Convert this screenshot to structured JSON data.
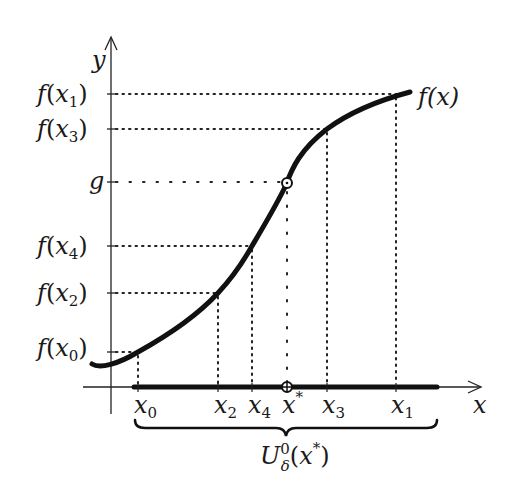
{
  "figure": {
    "axes": {
      "x_label": "x",
      "y_label": "y"
    },
    "curve_label": "f(x)",
    "y_ticks": [
      {
        "id": "fx1",
        "label_f": "f(",
        "label_var": "x",
        "label_sub": "1",
        "label_close": ")",
        "y": 94
      },
      {
        "id": "fx3",
        "label_f": "f(",
        "label_var": "x",
        "label_sub": "3",
        "label_close": ")",
        "y": 129
      },
      {
        "id": "g",
        "label": "g",
        "y": 182
      },
      {
        "id": "fx4",
        "label_f": "f(",
        "label_var": "x",
        "label_sub": "4",
        "label_close": ")",
        "y": 246
      },
      {
        "id": "fx2",
        "label_f": "f(",
        "label_var": "x",
        "label_sub": "2",
        "label_close": ")",
        "y": 293
      },
      {
        "id": "fx0",
        "label_f": "f(",
        "label_var": "x",
        "label_sub": "0",
        "label_close": ")",
        "y": 352
      }
    ],
    "x_ticks": [
      {
        "id": "x0",
        "var": "x",
        "sub": "0",
        "x": 138
      },
      {
        "id": "x2",
        "var": "x",
        "sub": "2",
        "x": 218
      },
      {
        "id": "x4",
        "var": "x",
        "sub": "4",
        "x": 252
      },
      {
        "id": "xstar",
        "var": "x",
        "sup": "*",
        "x": 287
      },
      {
        "id": "x3",
        "var": "x",
        "sub": "3",
        "x": 327
      },
      {
        "id": "x1",
        "var": "x",
        "sub": "1",
        "x": 396
      }
    ],
    "neighborhood_label": {
      "U": "U",
      "sup": "0",
      "sub": "δ",
      "arg": "(x*)"
    },
    "marked_point": "(x*, g)",
    "colors": {
      "ink": "#111111",
      "background": "#ffffff"
    }
  }
}
